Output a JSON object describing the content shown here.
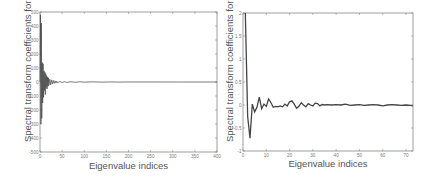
{
  "chart_data": [
    {
      "type": "line",
      "title": "",
      "xlabel": "Eigenvalue indices",
      "ylabel": "Spectral transform coefficients for",
      "ylabel_symbol": "x",
      "xlim": [
        0,
        400
      ],
      "ylim": [
        -500,
        500
      ],
      "xticks": [
        0,
        50,
        100,
        150,
        200,
        250,
        300,
        350,
        400
      ],
      "yticks": [
        -500,
        -400,
        -300,
        -200,
        -100,
        0,
        100,
        200,
        300,
        400,
        500
      ],
      "grid": false,
      "legend": null,
      "series": [
        {
          "name": "coefficients",
          "color": "#444444",
          "x": [
            0,
            1,
            2,
            3,
            4,
            5,
            6,
            7,
            8,
            9,
            10,
            11,
            12,
            13,
            14,
            15,
            16,
            17,
            18,
            19,
            20,
            22,
            24,
            26,
            28,
            30,
            32,
            34,
            36,
            38,
            40,
            45,
            50,
            55,
            60,
            70,
            80,
            90,
            100,
            120,
            140,
            160,
            180,
            200,
            250,
            300,
            350,
            400
          ],
          "y": [
            0,
            480,
            -300,
            420,
            -260,
            140,
            -150,
            130,
            -110,
            80,
            -60,
            70,
            -90,
            60,
            -40,
            45,
            -50,
            35,
            -30,
            30,
            -25,
            20,
            -20,
            15,
            -15,
            12,
            -10,
            8,
            -8,
            6,
            -5,
            4,
            -4,
            3,
            -3,
            2,
            -2,
            1.5,
            -1,
            1,
            -1,
            0.5,
            -0.5,
            0.3,
            0.2,
            0.1,
            0,
            0
          ]
        }
      ]
    },
    {
      "type": "line",
      "title": "",
      "xlabel": "Eigenvalue indices",
      "ylabel": "Spectral transform coefficients for",
      "ylabel_symbol": "x",
      "xlim": [
        0,
        73
      ],
      "ylim": [
        -1,
        2
      ],
      "xticks": [
        0,
        10,
        20,
        30,
        40,
        50,
        60,
        70
      ],
      "yticks": [
        -1,
        -0.5,
        0,
        0.5,
        1,
        1.5,
        2
      ],
      "grid": false,
      "legend": null,
      "series": [
        {
          "name": "coefficients",
          "color": "#444444",
          "x": [
            1,
            2,
            3,
            4,
            5,
            6,
            7,
            8,
            9,
            10,
            11,
            12,
            13,
            14,
            15,
            16,
            17,
            18,
            19,
            20,
            21,
            22,
            23,
            24,
            25,
            26,
            27,
            28,
            29,
            30,
            31,
            32,
            33,
            34,
            35,
            36,
            38,
            40,
            42,
            44,
            46,
            48,
            50,
            52,
            54,
            56,
            58,
            60,
            62,
            64,
            66,
            68,
            70,
            72,
            73
          ],
          "y": [
            2.0,
            -0.25,
            -0.72,
            0.02,
            -0.15,
            -0.05,
            0.17,
            -0.08,
            0.02,
            -0.03,
            0.13,
            0.05,
            -0.05,
            -0.03,
            -0.04,
            -0.02,
            -0.04,
            0.02,
            -0.02,
            0.07,
            0.09,
            0.02,
            -0.07,
            -0.03,
            0.05,
            0.0,
            -0.04,
            0.03,
            0.0,
            -0.02,
            0.04,
            0.03,
            -0.02,
            0.01,
            0.0,
            0.01,
            0.0,
            0.01,
            0.0,
            0.02,
            -0.01,
            0.0,
            0.01,
            -0.01,
            0.0,
            0.01,
            0.0,
            -0.02,
            0.0,
            0.01,
            0.0,
            -0.01,
            0.0,
            -0.01,
            -0.02
          ]
        }
      ]
    }
  ],
  "panels": [
    {
      "xlabel": "Eigenvalue indices",
      "ylabel": "Spectral transform coefficients for",
      "ylabel_symbol": "x"
    },
    {
      "xlabel": "Eigenvalue indices",
      "ylabel": "Spectral transform coefficients for",
      "ylabel_symbol": "x"
    }
  ]
}
